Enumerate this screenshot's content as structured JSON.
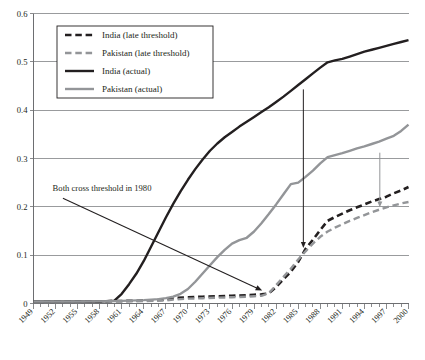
{
  "chart_data": {
    "type": "line",
    "title": "",
    "subtitle": "",
    "xlabel": "",
    "ylabel": "",
    "xlim": [
      1949,
      2000
    ],
    "ylim": [
      0,
      0.6
    ],
    "grid": true,
    "legend_position": "top-left",
    "y_ticks": [
      "0",
      "0.1",
      "0.2",
      "0.3",
      "0.4",
      "0.5",
      "0.6"
    ],
    "y_tick_values": [
      0,
      0.1,
      0.2,
      0.3,
      0.4,
      0.5,
      0.6
    ],
    "x_ticks": [
      "1949",
      "1952",
      "1955",
      "1958",
      "1961",
      "1964",
      "1967",
      "1970",
      "1973",
      "1976",
      "1979",
      "1982",
      "1985",
      "1988",
      "1991",
      "1994",
      "1997",
      "2000"
    ],
    "x_tick_values": [
      1949,
      1952,
      1955,
      1958,
      1961,
      1964,
      1967,
      1970,
      1973,
      1976,
      1979,
      1982,
      1985,
      1988,
      1991,
      1994,
      1997,
      2000
    ],
    "x_minor_step": 1,
    "series": [
      {
        "name": "India (late threshold)",
        "color": "#231f20",
        "style": "dashed",
        "width": 2.6,
        "x": [
          1949,
          1955,
          1960,
          1964,
          1967,
          1968,
          1970,
          1972,
          1974,
          1976,
          1978,
          1979,
          1980,
          1981,
          1982,
          1983,
          1984,
          1985,
          1986,
          1987,
          1988,
          1989,
          1990,
          1991,
          1992,
          1993,
          1994,
          1995,
          1996,
          1997,
          1998,
          1999,
          2000
        ],
        "values": [
          0.004,
          0.004,
          0.005,
          0.006,
          0.008,
          0.011,
          0.013,
          0.014,
          0.015,
          0.016,
          0.017,
          0.018,
          0.019,
          0.021,
          0.034,
          0.05,
          0.066,
          0.086,
          0.113,
          0.132,
          0.152,
          0.171,
          0.179,
          0.186,
          0.193,
          0.199,
          0.205,
          0.211,
          0.216,
          0.221,
          0.228,
          0.234,
          0.241
        ]
      },
      {
        "name": "Pakistan (late threshold)",
        "color": "#939598",
        "style": "dashed",
        "width": 2.4,
        "x": [
          1949,
          1955,
          1960,
          1964,
          1967,
          1968,
          1970,
          1972,
          1974,
          1976,
          1978,
          1979,
          1980,
          1981,
          1982,
          1983,
          1984,
          1985,
          1986,
          1987,
          1988,
          1989,
          1990,
          1991,
          1992,
          1993,
          1994,
          1995,
          1996,
          1997,
          1998,
          1999,
          2000
        ],
        "values": [
          0.003,
          0.003,
          0.004,
          0.005,
          0.006,
          0.008,
          0.01,
          0.011,
          0.012,
          0.013,
          0.014,
          0.015,
          0.016,
          0.021,
          0.038,
          0.055,
          0.072,
          0.091,
          0.108,
          0.124,
          0.138,
          0.149,
          0.157,
          0.164,
          0.171,
          0.177,
          0.183,
          0.189,
          0.194,
          0.199,
          0.203,
          0.207,
          0.21
        ]
      },
      {
        "name": "India (actual)",
        "color": "#231f20",
        "style": "solid",
        "width": 2.4,
        "x": [
          1949,
          1953,
          1956,
          1958,
          1959,
          1960,
          1961,
          1962,
          1963,
          1964,
          1965,
          1966,
          1967,
          1968,
          1969,
          1970,
          1971,
          1972,
          1973,
          1974,
          1975,
          1976,
          1977,
          1978,
          1979,
          1980,
          1981,
          1982,
          1983,
          1984,
          1985,
          1986,
          1987,
          1988,
          1989,
          1990,
          1991,
          1992,
          1993,
          1994,
          1995,
          1996,
          1997,
          1998,
          1999,
          2000
        ],
        "values": [
          0.004,
          0.004,
          0.004,
          0.004,
          0.005,
          0.006,
          0.02,
          0.04,
          0.062,
          0.088,
          0.118,
          0.148,
          0.178,
          0.206,
          0.232,
          0.256,
          0.278,
          0.298,
          0.316,
          0.331,
          0.344,
          0.355,
          0.366,
          0.376,
          0.386,
          0.396,
          0.406,
          0.417,
          0.428,
          0.44,
          0.452,
          0.464,
          0.476,
          0.488,
          0.499,
          0.503,
          0.506,
          0.511,
          0.516,
          0.521,
          0.525,
          0.529,
          0.533,
          0.537,
          0.541,
          0.545
        ]
      },
      {
        "name": "Pakistan (actual)",
        "color": "#939598",
        "style": "solid",
        "width": 2.4,
        "x": [
          1949,
          1955,
          1960,
          1962,
          1964,
          1966,
          1967,
          1968,
          1969,
          1970,
          1971,
          1972,
          1973,
          1974,
          1975,
          1976,
          1977,
          1978,
          1979,
          1980,
          1981,
          1982,
          1983,
          1984,
          1985,
          1986,
          1987,
          1988,
          1989,
          1990,
          1991,
          1992,
          1993,
          1994,
          1995,
          1996,
          1997,
          1998,
          1999,
          2000
        ],
        "values": [
          0.004,
          0.004,
          0.005,
          0.006,
          0.007,
          0.009,
          0.011,
          0.014,
          0.02,
          0.03,
          0.045,
          0.062,
          0.079,
          0.096,
          0.111,
          0.124,
          0.131,
          0.136,
          0.149,
          0.166,
          0.185,
          0.205,
          0.226,
          0.247,
          0.25,
          0.262,
          0.275,
          0.29,
          0.303,
          0.307,
          0.311,
          0.316,
          0.321,
          0.325,
          0.33,
          0.335,
          0.341,
          0.347,
          0.357,
          0.37
        ]
      }
    ],
    "annotations": [
      {
        "id": "threshold-note",
        "text": "Both cross threshold in 1980",
        "text_x": 1951.6,
        "text_y": 0.232,
        "arrow_from_x": 1953.0,
        "arrow_from_y": 0.218,
        "arrow_to_x": 1980.1,
        "arrow_to_y": 0.027,
        "color": "#231f20"
      },
      {
        "id": "india-gap-marker",
        "from_x": 1985.7,
        "from_y": 0.443,
        "to_x": 1985.7,
        "to_y": 0.115,
        "color": "#231f20"
      },
      {
        "id": "pakistan-gap-marker",
        "from_x": 1996.1,
        "from_y": 0.312,
        "to_x": 1996.1,
        "to_y": 0.199,
        "color": "#939598"
      }
    ]
  },
  "legend": {
    "items": [
      {
        "label": "India (late threshold)"
      },
      {
        "label": "Pakistan (late threshold)"
      },
      {
        "label": "India (actual)"
      },
      {
        "label": "Pakistan (actual)"
      }
    ]
  },
  "colors": {
    "india": "#231f20",
    "pakistan": "#939598",
    "grid": "#808285",
    "axis": "#6d6e71",
    "background": "#ffffff"
  }
}
